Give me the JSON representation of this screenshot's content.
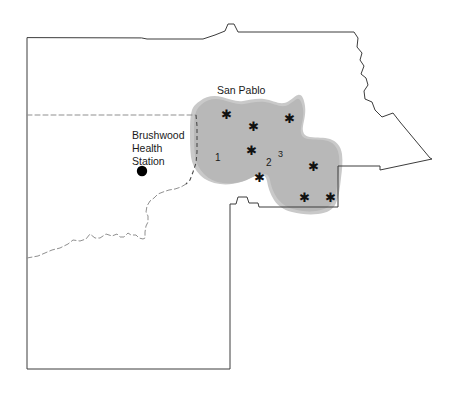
{
  "map": {
    "labels": {
      "city": "San Pablo",
      "station_line1": "Brushwood",
      "station_line2": "Health",
      "station_line3": "Station"
    },
    "site_numbers": [
      {
        "id": "site-1",
        "label": "1",
        "x": 215,
        "y": 161
      },
      {
        "id": "site-2",
        "label": "2",
        "x": 266,
        "y": 166
      },
      {
        "id": "site-3",
        "label": "3",
        "x": 278,
        "y": 157
      }
    ],
    "star_markers": [
      {
        "id": "star-1",
        "glyph": "✱",
        "x": 226,
        "y": 115
      },
      {
        "id": "star-2",
        "glyph": "✱",
        "x": 289,
        "y": 119
      },
      {
        "id": "star-3",
        "glyph": "✱",
        "x": 253,
        "y": 127
      },
      {
        "id": "star-4",
        "glyph": "✱",
        "x": 251,
        "y": 151
      },
      {
        "id": "star-5",
        "glyph": "✱",
        "x": 313,
        "y": 167
      },
      {
        "id": "star-6",
        "glyph": "✱",
        "x": 259,
        "y": 178
      },
      {
        "id": "star-7",
        "glyph": "✱",
        "x": 304,
        "y": 198
      },
      {
        "id": "star-8",
        "glyph": "✱",
        "x": 330,
        "y": 198
      }
    ],
    "station_marker": {
      "id": "brushwood-health-station",
      "x": 142,
      "y": 171,
      "r": 5.2
    },
    "colors": {
      "background": "#ffffff",
      "outline": "#3c3c3c",
      "internal_boundary": "#8f8f8f",
      "shaded_region": "#b8b8b8",
      "shaded_region_soft": "#c9c9c9",
      "text": "#1a1a1a",
      "station_dot": "#000000"
    },
    "geometry": {
      "county_outline": "M 27,38 L 27,369 L 230,369 L 230,204 L 236,204 L 238,197 L 247,197 L 249,203 L 258,203 L 259,207 L 338,207 L 338,166 L 380,166 L 380,170 L 432,159 L 430,158 L 400,122 L 393,113 L 382,117 L 375,110 L 372,102 L 365,99 L 364,91 L 368,85 L 366,78 L 361,74 L 364,66 L 360,60 L 362,53 L 357,47 L 358,38 L 354,32 L 238,32 L 234,24 L 228,24 L 225,31 L 215,35 L 203,39 L 147,39 L 142,38 Z",
      "internal_dashed": "M 27,115 L 196,115 M 27,258 L 38,256 L 52,250 L 60,248 L 68,244 L 73,240 L 80,241 L 86,239 L 90,234 L 95,238 L 100,238 L 106,234 L 112,236 L 117,234 L 120,237 L 124,237 L 128,233 L 131,235 L 136,235 L 139,238 L 143,239 L 145,238 L 145,232 L 146,226 L 148,222 L 148,216 L 146,212 L 147,206 L 150,201 L 154,198 L 158,194 L 163,192 L 169,190 L 175,189 L 181,187 L 186,184",
      "region_dashed_edge": "M 196,115 L 197,126 L 197,140 L 197,152 L 196,163 L 193,172 L 190,180 L 186,184"
    }
  }
}
